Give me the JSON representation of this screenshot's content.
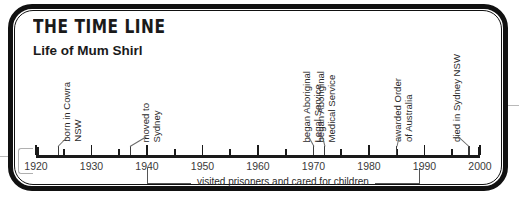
{
  "card": {
    "title": "THE TIME LINE",
    "subtitle": "Life of Mum Shirl"
  },
  "chart_data": {
    "type": "timeline",
    "title": "THE TIME LINE",
    "subtitle": "Life of Mum Shirl",
    "xlabel": "",
    "ylabel": "",
    "xlim": [
      1920,
      2000
    ],
    "grid": false,
    "legend": false,
    "axis": {
      "start_year": 1920,
      "end_year": 2000,
      "major_step": 10,
      "minor_step": 5,
      "tick_labels": [
        "1920",
        "1930",
        "1940",
        "1950",
        "1960",
        "1970",
        "1980",
        "1990",
        "2000"
      ],
      "tick_values": [
        1920,
        1930,
        1940,
        1950,
        1960,
        1970,
        1980,
        1990,
        2000
      ],
      "minor_tick_values": [
        1925,
        1935,
        1945,
        1955,
        1965,
        1975,
        1985,
        1995
      ]
    },
    "events": [
      {
        "label": "born in Cowra\nNSW",
        "year": 1924
      },
      {
        "label": "moved to\nSydney",
        "year": 1937
      },
      {
        "label": "began Aboriginal\nLegal Service",
        "year": 1970
      },
      {
        "label": "began Aboriginal\nMedical Service",
        "year": 1972
      },
      {
        "label": "awarded Order\nof Australia",
        "year": 1985
      },
      {
        "label": "died in Sydney NSW",
        "year": 1998
      }
    ],
    "span": {
      "label": "visited prisoners and cared for children",
      "start_year": 1940,
      "end_year": 1989
    }
  }
}
